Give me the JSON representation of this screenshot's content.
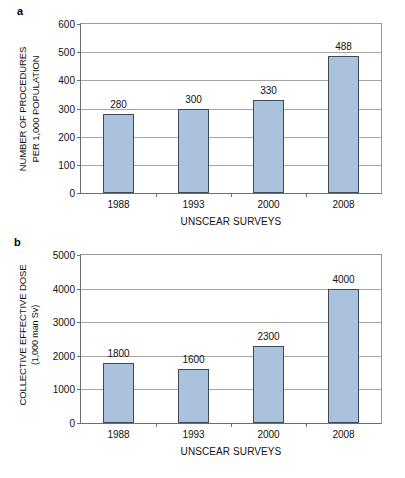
{
  "figure": {
    "background": "#ffffff",
    "bar_fill": "#aac2dc",
    "bar_border": "#3d4a5c",
    "grid_color": "#a6a6a6",
    "axis_color": "#6e6e6e"
  },
  "panels": {
    "a": {
      "label": "a"
    },
    "b": {
      "label": "b"
    }
  },
  "chart_data": [
    {
      "panel": "a",
      "type": "bar",
      "title": "",
      "categories": [
        "1988",
        "1993",
        "2000",
        "2008"
      ],
      "values": [
        280,
        300,
        330,
        488
      ],
      "data_labels": [
        "280",
        "300",
        "330",
        "488"
      ],
      "xlabel": "UNSCEAR SURVEYS",
      "ylabel_line1": "NUMBER OF PROCEDURES",
      "ylabel_line2": "PER 1,000 POPULATION",
      "ylim": [
        0,
        600
      ],
      "yticks": [
        0,
        100,
        200,
        300,
        400,
        500,
        600
      ],
      "ytick_labels": [
        "0",
        "100",
        "200",
        "300",
        "400",
        "500",
        "600"
      ],
      "grid": true,
      "legend": "none"
    },
    {
      "panel": "b",
      "type": "bar",
      "title": "",
      "categories": [
        "1988",
        "1993",
        "2000",
        "2008"
      ],
      "values": [
        1800,
        1600,
        2300,
        4000
      ],
      "data_labels": [
        "1800",
        "1600",
        "2300",
        "4000"
      ],
      "xlabel": "UNSCEAR SURVEYS",
      "ylabel_line1": "COLLECTIVE EFFECTIVE DOSE",
      "ylabel_line2": "(1,000 man Sv)",
      "ylim": [
        0,
        5000
      ],
      "yticks": [
        0,
        1000,
        2000,
        3000,
        4000,
        5000
      ],
      "ytick_labels": [
        "0",
        "1000",
        "2000",
        "3000",
        "4000",
        "5000"
      ],
      "grid": true,
      "legend": "none"
    }
  ]
}
